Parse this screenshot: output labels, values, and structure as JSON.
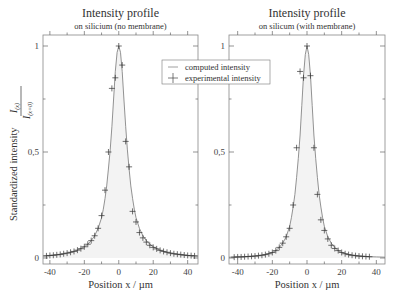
{
  "chart_data": [
    {
      "type": "line",
      "title": "Intensity profile",
      "subtitle": "on silicium (no membrane)",
      "xlabel": "Position  x / µm",
      "ylabel": "Standardized intensity",
      "ylabel_fraction": {
        "numerator": "I(x)",
        "denominator": "I(x=0)"
      },
      "xlim": [
        -44,
        46
      ],
      "ylim": [
        0,
        1.05
      ],
      "xticks": [
        -40,
        -20,
        0,
        20,
        40
      ],
      "xtick_labels": [
        "-40",
        "-20",
        "0",
        "20",
        "40"
      ],
      "yticks": [
        0,
        0.5,
        1
      ],
      "ytick_labels": [
        "0",
        "0,5",
        "1"
      ],
      "grid": false,
      "series": [
        {
          "name": "computed intensity",
          "style": "line",
          "x": [
            -44,
            -40,
            -36,
            -32,
            -28,
            -24,
            -20,
            -18,
            -16,
            -14,
            -12,
            -10,
            -9,
            -8,
            -7,
            -6,
            -5,
            -4,
            -3,
            -2,
            -1,
            0,
            1,
            2,
            3,
            4,
            5,
            6,
            7,
            8,
            9,
            10,
            12,
            14,
            16,
            18,
            20,
            24,
            28,
            32,
            36,
            40,
            44,
            46
          ],
          "y": [
            0.01,
            0.012,
            0.015,
            0.02,
            0.027,
            0.037,
            0.053,
            0.065,
            0.082,
            0.105,
            0.14,
            0.19,
            0.23,
            0.28,
            0.34,
            0.42,
            0.51,
            0.62,
            0.75,
            0.88,
            0.97,
            1.0,
            0.97,
            0.88,
            0.75,
            0.62,
            0.51,
            0.42,
            0.34,
            0.28,
            0.23,
            0.19,
            0.14,
            0.105,
            0.082,
            0.065,
            0.053,
            0.037,
            0.027,
            0.02,
            0.015,
            0.012,
            0.01,
            0.009
          ]
        },
        {
          "name": "experimental intensity",
          "style": "markers",
          "x": [
            -42,
            -40,
            -38,
            -36,
            -34,
            -32,
            -30,
            -28,
            -26,
            -24,
            -22,
            -20,
            -18,
            -16,
            -14,
            -12,
            -10,
            -8,
            -6,
            -4,
            -2,
            0,
            2,
            4,
            6,
            8,
            10,
            12,
            14,
            16,
            18,
            20,
            22,
            24,
            26,
            28,
            30,
            32,
            34,
            36,
            38,
            40,
            42,
            44
          ],
          "y": [
            0.01,
            0.012,
            0.013,
            0.015,
            0.017,
            0.02,
            0.023,
            0.027,
            0.031,
            0.037,
            0.044,
            0.053,
            0.065,
            0.082,
            0.105,
            0.14,
            0.2,
            0.32,
            0.5,
            0.8,
            0.85,
            1.0,
            0.91,
            0.55,
            0.43,
            0.22,
            0.17,
            0.12,
            0.095,
            0.075,
            0.06,
            0.05,
            0.043,
            0.036,
            0.031,
            0.027,
            0.023,
            0.02,
            0.018,
            0.016,
            0.014,
            0.012,
            0.011,
            0.01
          ]
        }
      ],
      "legend": {
        "entries": [
          "computed intensity",
          "experimental intensity"
        ],
        "placement": "top-right"
      }
    },
    {
      "type": "line",
      "title": "Intensity profile",
      "subtitle": "on silicum (with membrane)",
      "xlabel": "Position  x / µm",
      "ylabel": "",
      "xlim": [
        -45,
        45
      ],
      "ylim": [
        0,
        1.05
      ],
      "xticks": [
        -40,
        -20,
        0,
        20,
        40
      ],
      "xtick_labels": [
        "-40",
        "-20",
        "0",
        "20",
        "40"
      ],
      "yticks": [
        0,
        0.5,
        1
      ],
      "ytick_labels": [
        "0",
        "0,5",
        "1"
      ],
      "grid": false,
      "series": [
        {
          "name": "computed intensity",
          "style": "line",
          "x": [
            -45,
            -40,
            -36,
            -32,
            -28,
            -24,
            -20,
            -18,
            -16,
            -14,
            -12,
            -10,
            -9,
            -8,
            -7,
            -6,
            -5,
            -4,
            -3,
            -2,
            -1,
            0,
            1,
            2,
            3,
            4,
            5,
            6,
            7,
            8,
            9,
            10,
            12,
            14,
            16,
            18,
            20,
            24,
            28,
            32,
            36,
            40,
            45
          ],
          "y": [
            0.004,
            0.005,
            0.006,
            0.008,
            0.011,
            0.016,
            0.026,
            0.035,
            0.05,
            0.07,
            0.1,
            0.15,
            0.19,
            0.24,
            0.3,
            0.38,
            0.47,
            0.58,
            0.72,
            0.86,
            0.96,
            1.0,
            0.96,
            0.86,
            0.72,
            0.58,
            0.47,
            0.38,
            0.3,
            0.24,
            0.19,
            0.15,
            0.1,
            0.07,
            0.05,
            0.035,
            0.026,
            0.016,
            0.011,
            0.008,
            0.006,
            0.005,
            0.004
          ]
        },
        {
          "name": "experimental intensity",
          "style": "markers",
          "x": [
            -42,
            -40,
            -38,
            -36,
            -34,
            -32,
            -30,
            -28,
            -26,
            -24,
            -22,
            -20,
            -18,
            -16,
            -14,
            -12,
            -10,
            -8,
            -6,
            -4,
            -2,
            0,
            2,
            4,
            6,
            8,
            10,
            12,
            14,
            16,
            18,
            20,
            22,
            24,
            26,
            28,
            30,
            32,
            34,
            36
          ],
          "y": [
            0.004,
            0.005,
            0.005,
            0.006,
            0.007,
            0.008,
            0.009,
            0.011,
            0.013,
            0.016,
            0.02,
            0.026,
            0.035,
            0.05,
            0.07,
            0.1,
            0.14,
            0.25,
            0.52,
            0.88,
            0.85,
            1.0,
            0.86,
            0.52,
            0.3,
            0.18,
            0.13,
            0.09,
            0.06,
            0.045,
            0.035,
            0.026,
            0.02,
            0.016,
            0.013,
            0.011,
            0.009,
            0.008,
            0.007,
            0.006
          ]
        }
      ]
    }
  ]
}
